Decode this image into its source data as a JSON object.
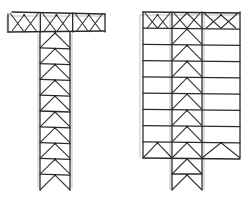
{
  "diagram": {
    "type": "line-drawing",
    "colors": {
      "background": "#ffffff",
      "line": "#2a2a2a",
      "ghost_line": "#b8b8b8"
    },
    "structures": [
      {
        "name": "t-shaped-truss",
        "shape": "T",
        "top_bar": {
          "x0": 8,
          "x1": 105,
          "y0": 12,
          "y1": 32,
          "bays": 3,
          "bracing": "chevron-x"
        },
        "column": {
          "x0": 40,
          "x1": 70,
          "y0": 32,
          "y1": 190,
          "bays": 10,
          "bracing": "inverted-v"
        }
      },
      {
        "name": "rectangular-frame-with-core",
        "shape": "rectangle-with-extended-core",
        "frame": {
          "x0": 143,
          "x1": 240,
          "y0": 12,
          "y1": 158,
          "floors": 9,
          "columns": [
            143,
            172,
            202,
            240
          ]
        },
        "core_bracing": "inverted-v",
        "top_row_bracing": "chevron-all-bays",
        "bottom_row_bracing": "chevron-all-bays",
        "core_extension": {
          "x0": 172,
          "x1": 202,
          "y0": 158,
          "y1": 190,
          "bays": 2,
          "bracing": "inverted-v"
        }
      }
    ]
  }
}
